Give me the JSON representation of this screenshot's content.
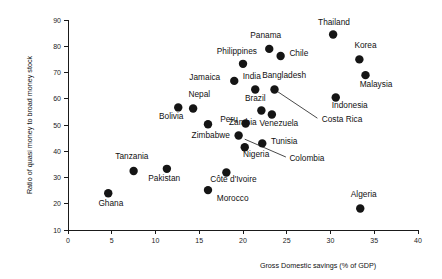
{
  "chart_data": {
    "type": "scatter",
    "title": "",
    "xlabel": "Gross Domestic savings (% of GDP)",
    "ylabel": "Ratio of quasi money to broad money stock",
    "xlim": [
      0,
      40
    ],
    "ylim": [
      10,
      90
    ],
    "xticks": [
      0,
      5,
      10,
      15,
      20,
      25,
      30,
      35,
      40
    ],
    "yticks": [
      10,
      20,
      30,
      40,
      50,
      60,
      70,
      80,
      90
    ],
    "xtick_labels": [
      "0",
      "5",
      "10",
      "15",
      "20",
      "25",
      "30",
      "35",
      "40"
    ],
    "ytick_labels": [
      "10",
      "20",
      "30",
      "40",
      "50",
      "60",
      "70",
      "80",
      "90"
    ],
    "grid": false,
    "legend": "none",
    "marker": "filled-circle",
    "marker_color": "#151515",
    "points": [
      {
        "label": "Ghana",
        "x": 4.6,
        "y": 24.0,
        "lx": 4.9,
        "ly": 19.0,
        "anchor": "middle"
      },
      {
        "label": "Tanzania",
        "x": 7.5,
        "y": 32.5,
        "lx": 7.3,
        "ly": 36.9,
        "anchor": "middle"
      },
      {
        "label": "Pakistan",
        "x": 11.3,
        "y": 33.3,
        "lx": 11.0,
        "ly": 28.6,
        "anchor": "middle"
      },
      {
        "label": "Bolivia",
        "x": 12.6,
        "y": 56.7,
        "lx": 11.8,
        "ly": 52.4,
        "anchor": "middle"
      },
      {
        "label": "Nepal",
        "x": 14.3,
        "y": 56.3,
        "lx": 15.0,
        "ly": 60.8,
        "anchor": "middle"
      },
      {
        "label": "Zambia",
        "x": 16.0,
        "y": 50.3,
        "lx": 18.4,
        "ly": 50.1,
        "anchor": "start"
      },
      {
        "label": "Morocco",
        "x": 16.0,
        "y": 25.2,
        "lx": 17.0,
        "ly": 21.2,
        "anchor": "start"
      },
      {
        "label": "Jamaica",
        "x": 19.0,
        "y": 66.8,
        "lx": 17.4,
        "ly": 67.1,
        "anchor": "end"
      },
      {
        "label": "Philippines",
        "x": 20.0,
        "y": 73.3,
        "lx": 19.3,
        "ly": 76.9,
        "anchor": "middle"
      },
      {
        "label": "Côte d'Ivoire",
        "x": 18.1,
        "y": 31.9,
        "lx": 18.9,
        "ly": 28.2,
        "anchor": "middle"
      },
      {
        "label": "Zimbabwe",
        "x": 19.5,
        "y": 46.0,
        "lx": 18.5,
        "ly": 45.0,
        "anchor": "end"
      },
      {
        "label": "Nigeria",
        "x": 20.2,
        "y": 41.5,
        "lx": 21.5,
        "ly": 37.7,
        "anchor": "middle"
      },
      {
        "label": "Peru",
        "x": 20.3,
        "y": 50.6,
        "lx": 19.4,
        "ly": 51.1,
        "anchor": "end"
      },
      {
        "label": "Tunisia",
        "x": 22.2,
        "y": 43.0,
        "lx": 23.2,
        "ly": 42.8,
        "anchor": "start"
      },
      {
        "label": "India",
        "x": 21.4,
        "y": 63.5,
        "lx": 21.0,
        "ly": 67.4,
        "anchor": "middle"
      },
      {
        "label": "Brazil",
        "x": 22.1,
        "y": 55.5,
        "lx": 21.4,
        "ly": 59.0,
        "anchor": "middle"
      },
      {
        "label": "Panama",
        "x": 23.0,
        "y": 79.0,
        "lx": 22.6,
        "ly": 83.0,
        "anchor": "middle"
      },
      {
        "label": "Venezuela",
        "x": 23.3,
        "y": 54.0,
        "lx": 24.1,
        "ly": 49.5,
        "anchor": "middle"
      },
      {
        "label": "Bangladesh",
        "x": 23.6,
        "y": 63.5,
        "lx": 24.7,
        "ly": 68.0,
        "anchor": "middle"
      },
      {
        "label": "Chile",
        "x": 24.3,
        "y": 76.3,
        "lx": 25.3,
        "ly": 76.1,
        "anchor": "start"
      },
      {
        "label": "Thailand",
        "x": 30.3,
        "y": 84.5,
        "lx": 30.4,
        "ly": 88.0,
        "anchor": "middle"
      },
      {
        "label": "Indonesia",
        "x": 30.6,
        "y": 60.5,
        "lx": 32.2,
        "ly": 56.4,
        "anchor": "middle"
      },
      {
        "label": "Korea",
        "x": 33.3,
        "y": 75.0,
        "lx": 34.0,
        "ly": 79.2,
        "anchor": "middle"
      },
      {
        "label": "Malaysia",
        "x": 34.0,
        "y": 69.0,
        "lx": 35.2,
        "ly": 64.6,
        "anchor": "middle"
      },
      {
        "label": "Algeria",
        "x": 33.4,
        "y": 18.2,
        "lx": 33.8,
        "ly": 22.5,
        "anchor": "middle"
      }
    ],
    "leader_labels": [
      {
        "label": "Costa Rica",
        "lx": 29.0,
        "ly": 51.3,
        "anchor": "start",
        "from_x": 23.6,
        "from_y": 63.5,
        "to_x": 28.5,
        "to_y": 52.6
      },
      {
        "label": "Colombia",
        "lx": 25.3,
        "ly": 36.3,
        "anchor": "start",
        "from_x": 20.2,
        "from_y": 44.6,
        "to_x": 24.9,
        "to_y": 37.8
      }
    ]
  }
}
